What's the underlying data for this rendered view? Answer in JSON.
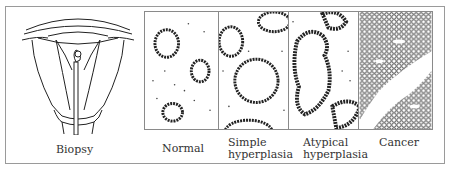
{
  "figure": {
    "biopsy_label": "Biopsy",
    "panels": [
      {
        "id": "normal",
        "label": "Normal"
      },
      {
        "id": "simple-hyperplasia",
        "label": "Simple hyperplasia"
      },
      {
        "id": "atypical-hyperplasia",
        "label": "Atypical hyperplasia"
      },
      {
        "id": "cancer",
        "label": "Cancer"
      }
    ]
  }
}
